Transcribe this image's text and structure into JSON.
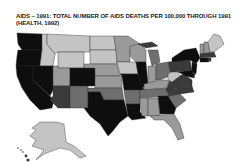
{
  "title_line1": "AIDS – 1991: TOTAL NUMBER OF AIDS DEATHS PER 100,000 THROUGH 1991",
  "title_line2": "(HEALTH, 1992)",
  "shades": {
    "darkest": "#0e0e0e",
    "dark": "#3a3a3a",
    "medium": "#6e6e6e",
    "light": "#9a9a9a",
    "lightest": "#c4c4c4"
  }
}
